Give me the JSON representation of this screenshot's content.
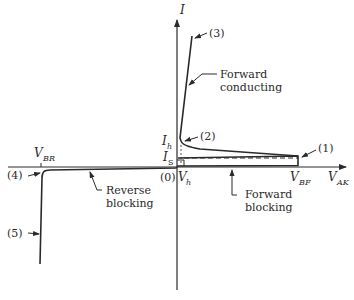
{
  "axes": {
    "y_label": "I",
    "x_label_main": "V",
    "x_label_sub": "AK"
  },
  "current_labels": {
    "holding_main": "I",
    "holding_sub": "h",
    "latching_main": "I",
    "latching_sub": "S"
  },
  "voltage_labels": {
    "breakover_main": "V",
    "breakover_sub": "BF",
    "reverse_breakdown_main": "V",
    "reverse_breakdown_sub": "BR",
    "holding_voltage_main": "V",
    "holding_voltage_sub": "h",
    "origin": "(0)"
  },
  "points": {
    "p1": "(1)",
    "p2": "(2)",
    "p3": "(3)",
    "p4": "(4)",
    "p5": "(5)"
  },
  "regions": {
    "forward_conducting_line1": "Forward",
    "forward_conducting_line2": "conducting",
    "forward_blocking_line1": "Forward",
    "forward_blocking_line2": "blocking",
    "reverse_blocking_line1": "Reverse",
    "reverse_blocking_line2": "blocking"
  },
  "colors": {
    "line": "#2a2a2a",
    "background": "#ffffff"
  }
}
